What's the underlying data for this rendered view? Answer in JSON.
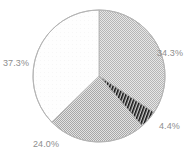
{
  "chart_data": {
    "type": "pie",
    "title": "",
    "subtitle": "",
    "xlabel": "",
    "ylabel": "",
    "grid": false,
    "legend_position": "none",
    "start_angle_deg": 0,
    "direction": "clockwise",
    "center": {
      "x": 99,
      "y": 76
    },
    "radius": 66,
    "labels": [
      "34.3%",
      "4.4%",
      "24.0%",
      "37.3%"
    ],
    "values": [
      34.3,
      4.4,
      24.0,
      37.3
    ],
    "total": 100.0,
    "slices": [
      {
        "label": "34.3%",
        "value": 34.3,
        "fill_name": "light-gray-checkerboard",
        "fill_color": "#bdbdbd",
        "fill_background": "#dcdcdc",
        "label_x": 157,
        "label_y": 48
      },
      {
        "label": "4.4%",
        "value": 4.4,
        "fill_name": "dark-dense-diagonal-hatch",
        "fill_color": "#1a1a1a",
        "fill_background": "#d0d0d0",
        "label_x": 159,
        "label_y": 121
      },
      {
        "label": "24.0%",
        "value": 24.0,
        "fill_name": "medium-gray-checkerboard",
        "fill_color": "#b0b0b0",
        "fill_background": "#d8d8d8",
        "label_x": 33,
        "label_y": 139
      },
      {
        "label": "37.3%",
        "value": 37.3,
        "fill_name": "white-plain",
        "fill_color": "#fdfdfd",
        "fill_background": "#ffffff",
        "label_x": 3,
        "label_y": 58
      }
    ]
  },
  "style": {
    "background_color": "#ffffff",
    "outline_color": "#b4b4b4",
    "label_text_color": "#8e8e8e"
  }
}
